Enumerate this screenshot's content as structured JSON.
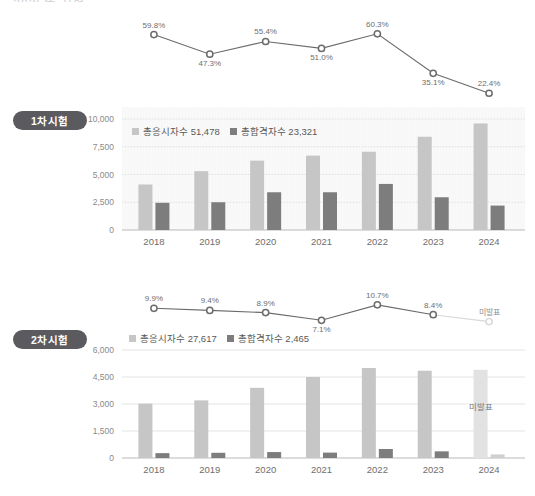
{
  "page": {
    "title_remnant": "·  2025年 시험"
  },
  "colors": {
    "bar_light": "#c6c6c6",
    "bar_dark": "#7d7d7d",
    "bar_light_faded": "#e2e2e2",
    "bar_dark_faded": "#d0d0d0",
    "line": "#6b6b6b",
    "line_faded": "#d8d8d8",
    "marker_fill": "#ffffff",
    "badge_bg": "#5b5b5f",
    "plot_bg": "#f7f7f7",
    "grid": "#e3e3e3",
    "axis": "#b9b9b9"
  },
  "sections": [
    {
      "badge": "1차시험",
      "legend": [
        {
          "label": "총응시자수 51,478",
          "swatch": "light"
        },
        {
          "label": "총합격자수 23,321",
          "swatch": "dark"
        }
      ],
      "chart_data": {
        "type": "bar",
        "title": "1차시험",
        "xlabel": "",
        "ylabel": "",
        "categories": [
          "2018",
          "2019",
          "2020",
          "2021",
          "2022",
          "2023",
          "2024"
        ],
        "ylim": [
          0,
          10000
        ],
        "yticks": [
          "0",
          "2,500",
          "5,000",
          "7,500",
          "10,000"
        ],
        "ytick_values": [
          0,
          2500,
          5000,
          7500,
          10000
        ],
        "grid": true,
        "legend_position": "top-left",
        "series": [
          {
            "name": "총응시자수",
            "values": [
              4100,
              5300,
              6250,
              6700,
              7050,
              8400,
              9600
            ],
            "color": "#c6c6c6"
          },
          {
            "name": "총합격자수",
            "values": [
              2450,
              2500,
              3400,
              3400,
              4150,
              2950,
              2200
            ],
            "color": "#7d7d7d"
          }
        ],
        "overlay_line": {
          "type": "line",
          "name": "합격률",
          "values": [
            59.8,
            47.3,
            55.4,
            51.0,
            60.3,
            35.1,
            22.4
          ],
          "labels": [
            "59.8%",
            "47.3%",
            "55.4%",
            "51.0%",
            "60.3%",
            "35.1%",
            "22.4%"
          ],
          "ylim": [
            20,
            64
          ]
        }
      }
    },
    {
      "badge": "2차시험",
      "legend": [
        {
          "label": "총응시자수 27,617",
          "swatch": "light"
        },
        {
          "label": "총합격자수 2,465",
          "swatch": "dark"
        }
      ],
      "unpublished_label": "미발표",
      "chart_data": {
        "type": "bar",
        "title": "2차시험",
        "xlabel": "",
        "ylabel": "",
        "categories": [
          "2018",
          "2019",
          "2020",
          "2021",
          "2022",
          "2023",
          "2024"
        ],
        "ylim": [
          0,
          6000
        ],
        "yticks": [
          "0",
          "1,500",
          "3,000",
          "4,500",
          "6,000"
        ],
        "ytick_values": [
          0,
          1500,
          3000,
          4500,
          6000
        ],
        "grid": true,
        "legend_position": "top-left",
        "series": [
          {
            "name": "총응시자수",
            "values": [
              3020,
              3200,
              3900,
              4500,
              5000,
              4850,
              4900
            ],
            "color": "#c6c6c6"
          },
          {
            "name": "총합격자수",
            "values": [
              270,
              290,
              330,
              300,
              500,
              370,
              200
            ],
            "color": "#7d7d7d"
          }
        ],
        "overlay_line": {
          "type": "line",
          "name": "합격률",
          "values": [
            9.9,
            9.4,
            8.9,
            7.1,
            10.7,
            8.4,
            6.8
          ],
          "labels": [
            "9.9%",
            "9.4%",
            "8.9%",
            "7.1%",
            "10.7%",
            "8.4%",
            "미발표"
          ],
          "ylim": [
            6.0,
            11.6
          ]
        }
      }
    }
  ]
}
